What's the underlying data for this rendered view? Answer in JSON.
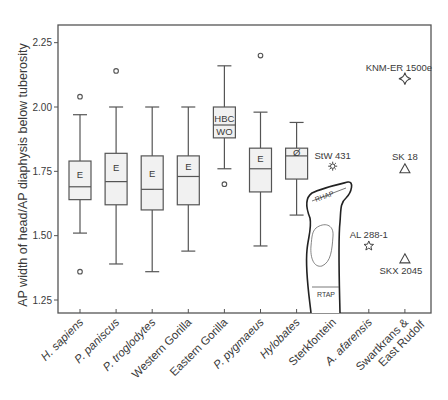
{
  "chart_data": {
    "type": "box",
    "title": "",
    "xlabel": "",
    "ylabel": "AP width of head/AP diaphysis below tuberosity",
    "ylim": [
      1.18,
      2.32
    ],
    "yticks": [
      "1.25",
      "1.50",
      "1.75",
      "2.00",
      "2.25"
    ],
    "ytick_values": [
      1.25,
      1.5,
      1.75,
      2.0,
      2.25
    ],
    "grid": false,
    "categories": [
      "H. sapiens",
      "P. paniscus",
      "P. troglodytes",
      "Western Gorilla",
      "Eastern Gorilla",
      "P. pygmaeus",
      "Hylobates",
      "Sterkfontein",
      "A. afarensis",
      "Swartkrans & East Rudolf"
    ],
    "category_lines": [
      [
        "H. sapiens"
      ],
      [
        "P. paniscus"
      ],
      [
        "P. troglodytes"
      ],
      [
        "Western Gorilla"
      ],
      [
        "Eastern Gorilla"
      ],
      [
        "P. pygmaeus"
      ],
      [
        "Hylobates"
      ],
      [
        "Sterkfontein"
      ],
      [
        "A. afarensis"
      ],
      [
        "Swartkrans &",
        "East Rudolf"
      ]
    ],
    "category_italic": [
      true,
      true,
      true,
      false,
      false,
      true,
      true,
      false,
      true,
      false
    ],
    "boxes": [
      {
        "category": "H. sapiens",
        "whisker_high": 1.97,
        "q3": 1.79,
        "median": 1.69,
        "q1": 1.64,
        "whisker_low": 1.51,
        "outliers": [
          2.04,
          1.36
        ],
        "label": "E"
      },
      {
        "category": "P. paniscus",
        "whisker_high": 2.0,
        "q3": 1.82,
        "median": 1.71,
        "q1": 1.62,
        "whisker_low": 1.39,
        "outliers": [
          2.14
        ],
        "label": "E"
      },
      {
        "category": "P. troglodytes",
        "whisker_high": 2.0,
        "q3": 1.81,
        "median": 1.68,
        "q1": 1.6,
        "whisker_low": 1.36,
        "outliers": [],
        "label": "E"
      },
      {
        "category": "Western Gorilla",
        "whisker_high": 2.0,
        "q3": 1.81,
        "median": 1.73,
        "q1": 1.62,
        "whisker_low": 1.44,
        "outliers": [],
        "label": "E"
      },
      {
        "category": "Eastern Gorilla",
        "whisker_high": 2.16,
        "q3": 2.0,
        "median": 1.93,
        "q1": 1.88,
        "whisker_low": 1.76,
        "outliers": [
          1.7
        ],
        "label_top": "HBC",
        "label_bottom": "WO"
      },
      {
        "category": "P. pygmaeus",
        "whisker_high": 1.98,
        "q3": 1.84,
        "median": 1.76,
        "q1": 1.67,
        "whisker_low": 1.46,
        "outliers": [
          2.2
        ],
        "label": "E"
      },
      {
        "category": "Hylobates",
        "whisker_high": 1.94,
        "q3": 1.84,
        "median": 1.81,
        "q1": 1.72,
        "whisker_low": 1.58,
        "outliers": [],
        "label": "Ø"
      }
    ],
    "points": [
      {
        "category": "Sterkfontein",
        "name": "StW 431",
        "value": 1.77,
        "marker": "sun"
      },
      {
        "category": "A. afarensis",
        "name": "AL 288-1",
        "value": 1.46,
        "marker": "star"
      },
      {
        "category": "Swartkrans & East Rudolf",
        "name": "KNM-ER 1500e",
        "value": 2.11,
        "marker": "diamond"
      },
      {
        "category": "Swartkrans & East Rudolf",
        "name": "SK 18",
        "value": 1.76,
        "marker": "triangle"
      },
      {
        "category": "Swartkrans & East Rudolf",
        "name": "SKX 2045",
        "value": 1.41,
        "marker": "triangle"
      }
    ],
    "inset_labels": {
      "top": "RHAP",
      "bottom": "RTAP"
    },
    "legend": null
  }
}
